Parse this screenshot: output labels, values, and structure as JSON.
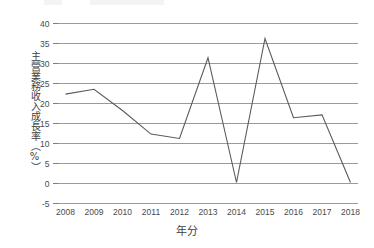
{
  "chart_data": {
    "type": "line",
    "title": "",
    "xlabel": "年分",
    "ylabel": "主營業務收入成長率（%）",
    "categories": [
      "2008",
      "2009",
      "2010",
      "2011",
      "2012",
      "2013",
      "2014",
      "2015",
      "2016",
      "2017",
      "2018"
    ],
    "values": [
      22.1,
      23.3,
      18.0,
      12.1,
      11.0,
      31.2,
      0.0,
      36.0,
      16.2,
      16.9,
      0.0
    ],
    "series": [
      {
        "name": "主營業務收入成長率",
        "values": [
          22.1,
          23.3,
          18.0,
          12.1,
          11.0,
          31.2,
          0.0,
          36.0,
          16.2,
          16.9,
          0.0
        ]
      }
    ],
    "ylim": [
      -5,
      40
    ],
    "yticks": [
      40,
      35,
      30,
      25,
      20,
      15,
      10,
      5,
      0,
      -5
    ],
    "ytick_labels": [
      "40",
      "35",
      "30",
      "25",
      "20",
      "15",
      "10",
      "5",
      "0",
      "-5"
    ],
    "grid": true,
    "grid_axis": "y",
    "legend": false,
    "legend_position": "none",
    "line_color": "#5a5a5a",
    "grid_color": "#9a9a9a",
    "background_color": "#ffffff",
    "text_color": "#4a4a4a"
  }
}
